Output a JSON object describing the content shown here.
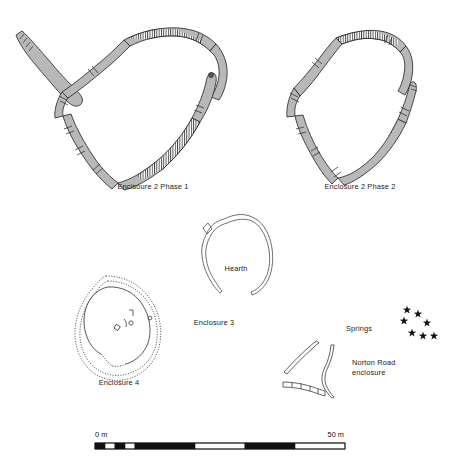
{
  "figure": {
    "kind": "archaeological-site-plan",
    "background_color": "#ffffff",
    "line_color": "#2b2b2b",
    "ditch_fill_color": "#b8b8b8"
  },
  "labels": {
    "enclosure2_phase1": "Enclsoure 2 Phase 1",
    "enclosure2_phase2": "Enclosure 2 Phase 2",
    "enclosure3": "Enclosure 3",
    "enclosure4": "Enclosure 4",
    "hearth": "Hearth",
    "springs": "Springs",
    "norton_road_line1": "Norton Road",
    "norton_road_line2": "enclosure"
  },
  "scale_bar": {
    "left_label": "0 m",
    "right_label": "50 m",
    "min_value": 0,
    "max_value": 50,
    "units": "m",
    "major_divisions": 5,
    "minor_divisions": 5
  },
  "springs_marker": {
    "icon": "star-icon",
    "count": 7,
    "points": [
      [
        407,
        310
      ],
      [
        418,
        314
      ],
      [
        404,
        321
      ],
      [
        427,
        323
      ],
      [
        412,
        333
      ],
      [
        423,
        336
      ],
      [
        434,
        336
      ]
    ]
  },
  "features": [
    {
      "name": "Enclosure 2 Phase 1",
      "type": "ditched enclosure",
      "has_hatching": true
    },
    {
      "name": "Enclosure 2 Phase 2",
      "type": "ditched enclosure",
      "has_hatching": true
    },
    {
      "name": "Enclosure 3",
      "type": "outline enclosure",
      "has_hatching": false
    },
    {
      "name": "Enclosure 4",
      "type": "dotted ring enclosure",
      "has_hatching": false
    },
    {
      "name": "Norton Road enclosure",
      "type": "linear ditch segments",
      "has_hatching": false
    }
  ]
}
